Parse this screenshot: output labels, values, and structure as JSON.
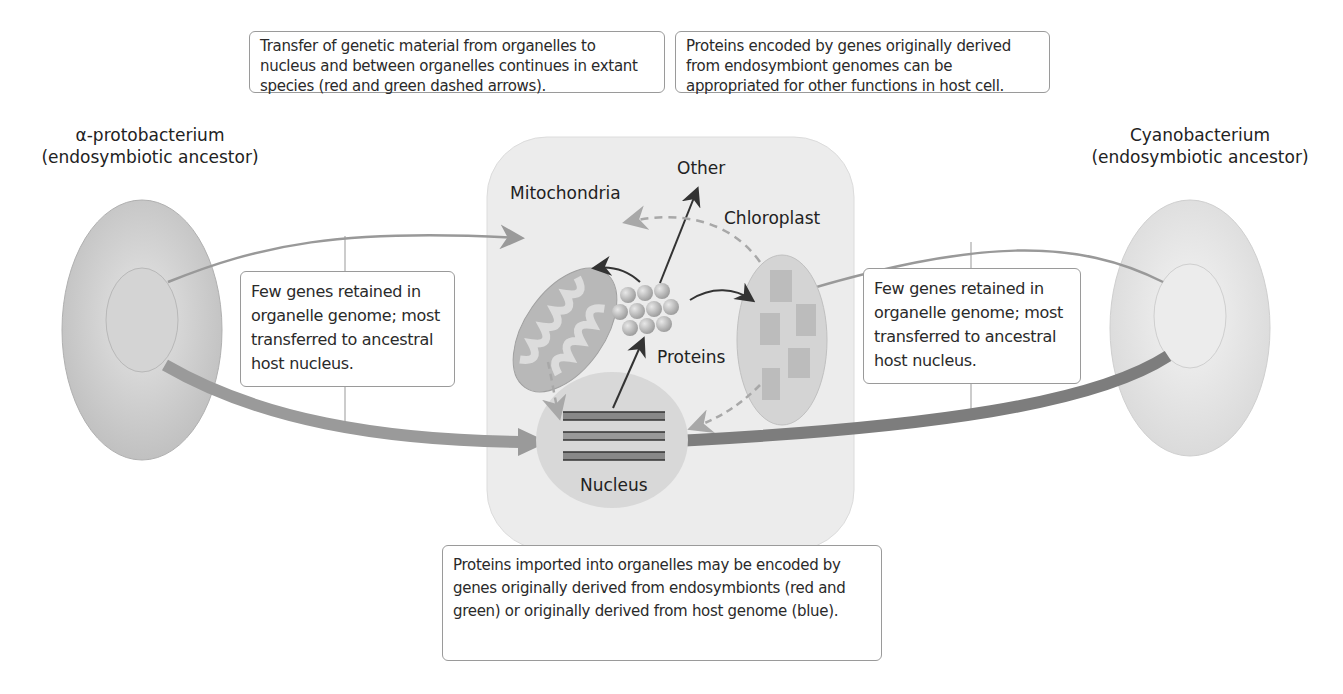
{
  "captions": {
    "top_left": "Transfer of genetic material from organelles to nucleus and between organelles continues in extant species (red and green dashed arrows).",
    "top_right": "Proteins encoded by genes originally derived from endosymbiont genomes can be appropriated for other functions in host cell.",
    "left_mid": "Few genes retained in organelle genome; most transferred to ancestral host nucleus.",
    "right_mid": "Few genes retained in organelle genome; most transferred to ancestral host nucleus.",
    "bottom": "Proteins imported into organelles may be encoded by genes originally derived from endosymbionts (red and green) or originally derived from host genome (blue)."
  },
  "ancestors": {
    "left": {
      "name": "α-protobacterium",
      "sub": "(endosymbiotic ancestor)"
    },
    "right": {
      "name": "Cyanobacterium",
      "sub": "(endosymbiotic ancestor)"
    }
  },
  "cell": {
    "mitochondria": "Mitochondria",
    "chloroplast": "Chloroplast",
    "other": "Other",
    "proteins": "Proteins",
    "nucleus": "Nucleus"
  },
  "colors": {
    "cell_bg": "#ececec",
    "bacterium": "#c8c8c8",
    "arrow_gray": "#9a9a9a",
    "dashed": "#a0a0a0",
    "dark_arrow": "#333333"
  }
}
